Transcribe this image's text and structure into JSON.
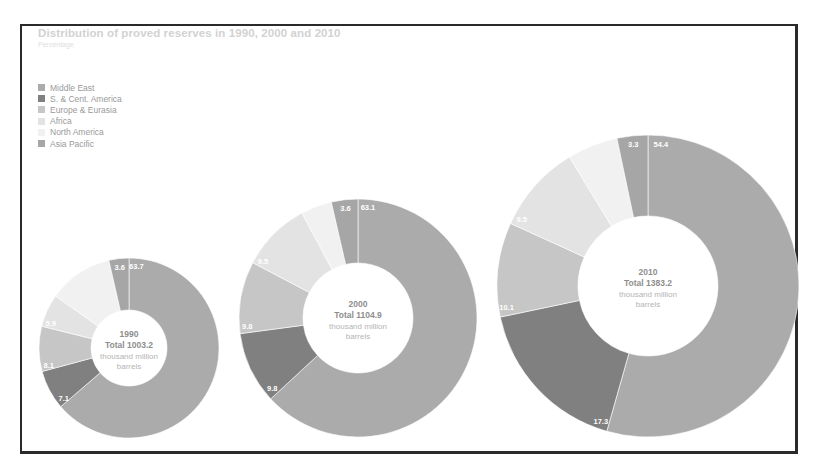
{
  "chart_data": {
    "type": "pie",
    "variant": "donut",
    "title": "Distribution of proved reserves in 1990, 2000 and 2010",
    "subtitle": "Percentage",
    "legend": {
      "position": "top-left",
      "entries": [
        {
          "name": "Middle East",
          "color": "#ababab"
        },
        {
          "name": "S. & Cent. America",
          "color": "#808080"
        },
        {
          "name": "Europe & Eurasia",
          "color": "#c6c6c6"
        },
        {
          "name": "Africa",
          "color": "#e3e3e3"
        },
        {
          "name": "North America",
          "color": "#f1f1f1"
        },
        {
          "name": "Asia Pacific",
          "color": "#a6a6a6"
        }
      ]
    },
    "categories": [
      "Middle East",
      "S. & Cent. America",
      "Europe & Eurasia",
      "Africa",
      "North America",
      "Asia Pacific"
    ],
    "charts": [
      {
        "year": "1990",
        "total_label": "Total 1003.2",
        "unit_line1": "thousand million",
        "unit_line2": "barrels",
        "values": [
          63.7,
          7.1,
          8.1,
          5.9,
          11.6,
          3.6
        ],
        "labels": [
          "63.7",
          "7.1",
          "8.1",
          "5.9",
          "",
          "3.6"
        ],
        "cx": 129,
        "cy": 348,
        "r_outer": 90,
        "r_inner": 38
      },
      {
        "year": "2000",
        "total_label": "Total 1104.9",
        "unit_line1": "thousand million",
        "unit_line2": "barrels",
        "values": [
          63.1,
          9.8,
          9.8,
          9.5,
          4.2,
          3.6
        ],
        "labels": [
          "63.1",
          "9.8",
          "9.8",
          "9.5",
          "",
          "3.6"
        ],
        "cx": 358,
        "cy": 318,
        "r_outer": 119,
        "r_inner": 55
      },
      {
        "year": "2010",
        "total_label": "Total 1383.2",
        "unit_line1": "thousand million",
        "unit_line2": "barrels",
        "values": [
          54.4,
          17.3,
          10.1,
          9.5,
          5.4,
          3.3
        ],
        "labels": [
          "54.4",
          "17.3",
          "10.1",
          "9.5",
          "",
          "3.3"
        ],
        "cx": 648,
        "cy": 286,
        "r_outer": 151,
        "r_inner": 70
      }
    ]
  },
  "header": {
    "title": "Distribution of proved reserves in 1990, 2000 and 2010",
    "subtitle": "Percentage"
  },
  "legend": {
    "items": [
      {
        "label": "Middle East",
        "color": "#ababab"
      },
      {
        "label": "S. & Cent. America",
        "color": "#808080"
      },
      {
        "label": "Europe & Eurasia",
        "color": "#c6c6c6"
      },
      {
        "label": "Africa",
        "color": "#e3e3e3"
      },
      {
        "label": "North America",
        "color": "#f1f1f1"
      },
      {
        "label": "Asia Pacific",
        "color": "#a6a6a6"
      }
    ]
  }
}
